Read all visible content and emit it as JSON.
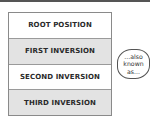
{
  "diagram": {
    "rows": [
      {
        "label": "ROOT POSITION",
        "shade": "white"
      },
      {
        "label": "FIRST INVERSION",
        "shade": "gray"
      },
      {
        "label": "SECOND INVERSION",
        "shade": "white"
      },
      {
        "label": "THIRD INVERSION",
        "shade": "gray"
      }
    ],
    "callout": {
      "lines": [
        "...also",
        "known",
        "as..."
      ]
    },
    "colors": {
      "gray_row": "#e3e3e3",
      "white_row": "#ffffff",
      "border": "#8a8a8a",
      "text": "#2a2a2a"
    }
  }
}
